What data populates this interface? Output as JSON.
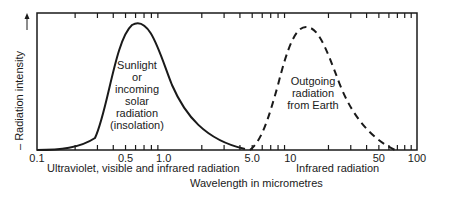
{
  "chart_data": {
    "type": "line",
    "title": "",
    "xlabel": "Wavelength in micrometres",
    "ylabel": "Radiation intensity",
    "xscale": "log",
    "xlim": [
      0.1,
      100
    ],
    "x_tick_labels": [
      "0.1",
      "0.5",
      "1.0",
      "5.0",
      "10",
      "50",
      "100"
    ],
    "x_ticks": [
      0.1,
      0.5,
      1.0,
      5.0,
      10,
      50,
      100
    ],
    "region_labels": [
      {
        "text": "Ultraviolet, visible and infrared radiation",
        "under": "solar"
      },
      {
        "text": "Infrared radiation",
        "under": "earth"
      }
    ],
    "series": [
      {
        "name": "Sunlight or incoming solar radiation (insolation)",
        "style": "solid",
        "peak_wavelength_um": 0.55,
        "range_um": [
          0.15,
          4.0
        ],
        "relative_peak": 1.0,
        "label_lines": [
          "Sunlight",
          "or",
          "incoming",
          "solar",
          "radiation",
          "(insolation)"
        ]
      },
      {
        "name": "Outgoing radiation from Earth",
        "style": "dashed",
        "peak_wavelength_um": 12,
        "range_um": [
          4.0,
          90
        ],
        "relative_peak": 0.98,
        "label_lines": [
          "Outgoing",
          "radiation",
          "from Earth"
        ]
      }
    ],
    "grid": false,
    "legend": "none (inline labels)"
  },
  "labels": {
    "ylabel": "– Radiation intensity",
    "xlabel": "Wavelength in micrometres",
    "region_solar": "Ultraviolet, visible and infrared radiation",
    "region_earth": "Infrared radiation",
    "ticks": [
      "0.1",
      "0.5",
      "1.0",
      "5.0",
      "10",
      "50",
      "100"
    ],
    "solar_lines": [
      "Sunlight",
      "or",
      "incoming",
      "solar",
      "radiation",
      "(insolation)"
    ],
    "earth_lines": [
      "Outgoing",
      "radiation",
      "from Earth"
    ]
  },
  "colors": {
    "ink": "#1a1a1a",
    "background": "#ffffff"
  }
}
